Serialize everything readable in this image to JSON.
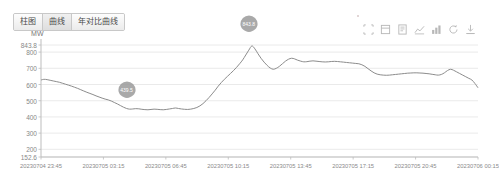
{
  "tabs": [
    {
      "label": "柱图",
      "active": false
    },
    {
      "label": "曲线",
      "active": true
    },
    {
      "label": "年对比曲线",
      "active": false
    }
  ],
  "toolbox": [
    {
      "name": "area-zoom-icon",
      "title": "区域缩放"
    },
    {
      "name": "zoom-restore-icon",
      "title": "区域缩放还原"
    },
    {
      "name": "data-view-icon",
      "title": "数据视图"
    },
    {
      "name": "line-chart-icon",
      "title": "切换为折线图"
    },
    {
      "name": "bar-chart-icon",
      "title": "切换为柱状图"
    },
    {
      "name": "restore-icon",
      "title": "还原"
    },
    {
      "name": "download-icon",
      "title": "保存为图片"
    }
  ],
  "chart_data": {
    "type": "line",
    "title": "",
    "xlabel": "",
    "ylabel": "MW",
    "unit": "MW",
    "ylim": [
      152.6,
      843.8
    ],
    "yticks": [
      "843.8",
      "800",
      "700",
      "600",
      "500",
      "400",
      "300",
      "200",
      "152.6"
    ],
    "ytick_values": [
      843.8,
      800,
      700,
      600,
      500,
      400,
      300,
      200,
      152.6
    ],
    "xticks": [
      "20230704 23:45",
      "20230705 03:15",
      "20230705 06:45",
      "20230705 10:15",
      "20230705 13:45",
      "20230705 17:15",
      "20230705 20:45",
      "20230706 00:15"
    ],
    "grid": true,
    "legend": "none",
    "line_color": "#8c8c8c",
    "markers": [
      {
        "type": "min",
        "label": "439.5",
        "x_index": 28,
        "value": 439.5
      },
      {
        "type": "max",
        "label": "843.8",
        "x_index": 68,
        "value": 843.8
      }
    ],
    "x": [
      0,
      1,
      2,
      3,
      4,
      5,
      6,
      7,
      8,
      9,
      10,
      11,
      12,
      13,
      14,
      15,
      16,
      17,
      18,
      19,
      20,
      21,
      22,
      23,
      24,
      25,
      26,
      27,
      28,
      29,
      30,
      31,
      32,
      33,
      34,
      35,
      36,
      37,
      38,
      39,
      40,
      41,
      42,
      43,
      44,
      45,
      46,
      47,
      48,
      49,
      50,
      51,
      52,
      53,
      54,
      55,
      56,
      57,
      58,
      59,
      60,
      61,
      62,
      63,
      64,
      65,
      66,
      67,
      68,
      69,
      70,
      71,
      72,
      73,
      74,
      75,
      76,
      77,
      78,
      79,
      80,
      81,
      82,
      83,
      84,
      85,
      86,
      87,
      88,
      89,
      90,
      91,
      92,
      93,
      94,
      95,
      96,
      97,
      98,
      99,
      100,
      101,
      102,
      103,
      104,
      105,
      106,
      107,
      108,
      109,
      110,
      111,
      112,
      113,
      114,
      115,
      116,
      117,
      118,
      119,
      120,
      121,
      122,
      123,
      124,
      125,
      126,
      127,
      128,
      129,
      130,
      131,
      132,
      133,
      134,
      135,
      136,
      137,
      138,
      139,
      140,
      141,
      142,
      143
    ],
    "values": [
      628,
      632,
      630,
      626,
      622,
      618,
      614,
      608,
      602,
      596,
      590,
      583,
      576,
      568,
      560,
      552,
      545,
      538,
      530,
      523,
      516,
      510,
      505,
      498,
      489,
      480,
      470,
      460,
      452,
      448,
      449,
      451,
      450,
      447,
      445,
      444,
      446,
      448,
      447,
      445,
      444,
      446,
      449,
      452,
      455,
      452,
      449,
      447,
      446,
      448,
      452,
      458,
      468,
      482,
      500,
      520,
      542,
      565,
      590,
      612,
      632,
      650,
      668,
      686,
      706,
      728,
      752,
      782,
      812,
      838,
      820,
      790,
      762,
      738,
      718,
      702,
      694,
      700,
      712,
      728,
      744,
      756,
      762,
      758,
      750,
      744,
      740,
      741,
      744,
      746,
      744,
      742,
      740,
      739,
      740,
      742,
      743,
      742,
      740,
      738,
      736,
      734,
      732,
      730,
      728,
      722,
      712,
      698,
      684,
      672,
      664,
      660,
      658,
      657,
      658,
      660,
      662,
      664,
      666,
      668,
      670,
      671,
      672,
      672,
      671,
      670,
      668,
      666,
      663,
      660,
      658,
      662,
      672,
      686,
      694,
      688,
      678,
      668,
      658,
      648,
      638,
      628,
      606,
      580
    ]
  }
}
